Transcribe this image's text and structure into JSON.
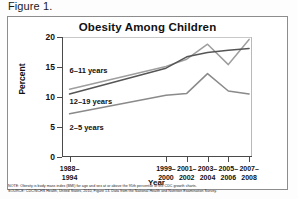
{
  "figure": {
    "label": "Figure 1."
  },
  "chart_data": {
    "type": "line",
    "title": "Obesity Among Children",
    "xlabel": "Year",
    "ylabel": "Percent",
    "ylim": [
      0,
      20
    ],
    "yticks": [
      0,
      5,
      10,
      15,
      20
    ],
    "ytick_labels": [
      "0",
      "5",
      "10",
      "15",
      "20"
    ],
    "grid": false,
    "legend_position": "inline-labels",
    "categories": [
      "1988–1994",
      "1999–2000",
      "2001–2002",
      "2003–2004",
      "2005–2006",
      "2007–2008"
    ],
    "category_lines": [
      [
        "1988–",
        "1994"
      ],
      [
        "1999–",
        "2000"
      ],
      [
        "2001–",
        "2002"
      ],
      [
        "2003–",
        "2004"
      ],
      [
        "2005–",
        "2006"
      ],
      [
        "2007–",
        "2008"
      ]
    ],
    "x_positions_pct": [
      4,
      55,
      66,
      77,
      88,
      99
    ],
    "series": [
      {
        "name": "6–11 years",
        "color": "#9e9e9e",
        "values": [
          11.3,
          15.1,
          16.3,
          18.8,
          15.4,
          19.6
        ],
        "label_left_pct": 4,
        "label_top_pct": 24
      },
      {
        "name": "12–19 years",
        "color": "#555555",
        "values": [
          10.5,
          14.8,
          16.7,
          17.4,
          17.8,
          18.1
        ],
        "label_left_pct": 4,
        "label_top_pct": 50
      },
      {
        "name": "2–5 years",
        "color": "#8a8a8a",
        "values": [
          7.2,
          10.3,
          10.6,
          13.9,
          11.0,
          10.5
        ],
        "label_left_pct": 4,
        "label_top_pct": 72
      }
    ]
  },
  "footnote": {
    "note": "NOTE: Obesity is body mass index (BMI) for age and sex at or above the 95th percentile of the CDC growth charts.",
    "source": "SOURCE: CDC/NCHS Health, United States, 2010, Figure 13. Data from the National Health and Nutrition Examination Survey."
  }
}
